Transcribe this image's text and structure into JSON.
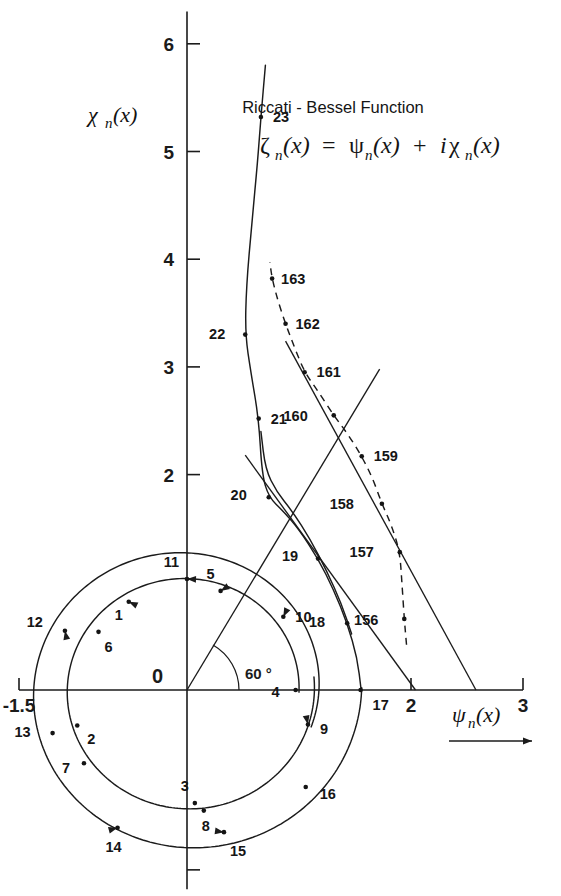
{
  "figure": {
    "title": "Riccati - Bessel Function",
    "formula_parts": {
      "zeta": "ζ",
      "sub_n": "n",
      "of_x": "(x)",
      "equals": "=",
      "psi": "ψ",
      "plus": "+",
      "i": "i",
      "chi": "χ"
    },
    "formula_plain": "ζₙ(x) = ψₙ(x) + iχₙ(x)",
    "background_color": "#ffffff",
    "ink_color": "#1b1b1b"
  },
  "axes": {
    "x_label_glyph": "ψ",
    "x_label_sub": "n",
    "x_label_tail": "(x)",
    "x_label_plain": "ψn(x)",
    "y_label_glyph": "χ",
    "y_label_sub": "n",
    "y_label_tail": "(x)",
    "y_label_plain": "χn(x)",
    "origin_label": "0",
    "angle_label": "60 °",
    "x_ticks": [
      {
        "value": -1.5,
        "label": "-1.5"
      },
      {
        "value": 2,
        "label": "2"
      },
      {
        "value": 3,
        "label": "3"
      }
    ],
    "y_ticks": [
      {
        "value": 2,
        "label": "2"
      },
      {
        "value": 3,
        "label": "3"
      },
      {
        "value": 4,
        "label": "4"
      },
      {
        "value": 5,
        "label": "5"
      },
      {
        "value": 6,
        "label": "6"
      }
    ],
    "x_range": [
      -1.5,
      3.0
    ],
    "y_range": [
      -1.85,
      6.3
    ],
    "grid": false
  },
  "chart_data": {
    "type": "scatter",
    "title": "Riccati - Bessel Function",
    "xlabel": "ψn(x)",
    "ylabel": "χn(x)",
    "xlim": [
      -1.5,
      3.0
    ],
    "ylim": [
      -1.85,
      6.3
    ],
    "grid": false,
    "legend_position": "none",
    "series": [
      {
        "name": "inner-loop",
        "style": "solid",
        "labels": [
          "1",
          "2",
          "3",
          "4",
          "5",
          "6",
          "7",
          "8"
        ],
        "points": [
          {
            "n": "1",
            "x": -0.52,
            "y": 0.82
          },
          {
            "n": "2",
            "x": -0.98,
            "y": -0.33
          },
          {
            "n": "3",
            "x": 0.07,
            "y": -1.05
          },
          {
            "n": "4",
            "x": 0.97,
            "y": 0.0
          },
          {
            "n": "5",
            "x": 0.3,
            "y": 0.92
          },
          {
            "n": "6",
            "x": -0.79,
            "y": 0.54
          },
          {
            "n": "7",
            "x": -0.92,
            "y": -0.68
          },
          {
            "n": "8",
            "x": 0.15,
            "y": -1.12
          }
        ]
      },
      {
        "name": "outer-loop",
        "style": "solid",
        "labels": [
          "9",
          "10",
          "11",
          "12",
          "13",
          "14",
          "15",
          "16",
          "17"
        ],
        "points": [
          {
            "n": "9",
            "x": 1.08,
            "y": -0.32
          },
          {
            "n": "10",
            "x": 0.86,
            "y": 0.68
          },
          {
            "n": "11",
            "x": 0.0,
            "y": 1.03
          },
          {
            "n": "12",
            "x": -1.09,
            "y": 0.55
          },
          {
            "n": "13",
            "x": -1.2,
            "y": -0.4
          },
          {
            "n": "14",
            "x": -0.62,
            "y": -1.28
          },
          {
            "n": "15",
            "x": 0.33,
            "y": -1.32
          },
          {
            "n": "16",
            "x": 1.06,
            "y": -0.9
          },
          {
            "n": "17",
            "x": 1.55,
            "y": 0.0
          }
        ]
      },
      {
        "name": "ascending-branch",
        "style": "solid",
        "labels": [
          "18",
          "19",
          "20",
          "21",
          "22",
          "23"
        ],
        "points": [
          {
            "n": "18",
            "x": 1.43,
            "y": 0.62
          },
          {
            "n": "19",
            "x": 1.17,
            "y": 1.22
          },
          {
            "n": "20",
            "x": 0.73,
            "y": 1.79
          },
          {
            "n": "21",
            "x": 0.64,
            "y": 2.52
          },
          {
            "n": "22",
            "x": 0.52,
            "y": 3.3
          },
          {
            "n": "23",
            "x": 0.66,
            "y": 5.32
          }
        ]
      },
      {
        "name": "high-order-branch",
        "style": "dashed",
        "labels": [
          "156",
          "157",
          "158",
          "159",
          "160",
          "161",
          "162",
          "163"
        ],
        "points": [
          {
            "n": "156",
            "x": 1.94,
            "y": 0.66
          },
          {
            "n": "157",
            "x": 1.9,
            "y": 1.28
          },
          {
            "n": "158",
            "x": 1.74,
            "y": 1.73
          },
          {
            "n": "159",
            "x": 1.56,
            "y": 2.17
          },
          {
            "n": "160",
            "x": 1.31,
            "y": 2.55
          },
          {
            "n": "161",
            "x": 1.05,
            "y": 2.95
          },
          {
            "n": "162",
            "x": 0.88,
            "y": 3.4
          },
          {
            "n": "163",
            "x": 0.76,
            "y": 3.82
          }
        ]
      }
    ],
    "reference_lines": [
      {
        "name": "sixty-degree-ray",
        "from": [
          0,
          0
        ],
        "to": [
          1.72,
          2.98
        ],
        "angle_deg": 60,
        "style": "solid"
      },
      {
        "name": "asymptote-left",
        "from": [
          0.52,
          2.18
        ],
        "to": [
          2.04,
          0.0
        ],
        "style": "solid"
      },
      {
        "name": "asymptote-right",
        "from": [
          0.88,
          3.24
        ],
        "to": [
          2.58,
          0.0
        ],
        "style": "solid"
      }
    ]
  }
}
